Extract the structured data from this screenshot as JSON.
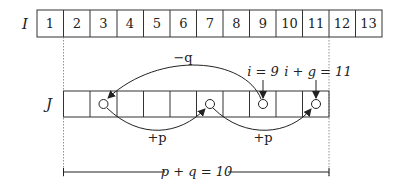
{
  "diagram": {
    "array_I": {
      "label": "I",
      "cells": [
        "1",
        "2",
        "3",
        "4",
        "5",
        "6",
        "7",
        "8",
        "9",
        "10",
        "11",
        "12",
        "13"
      ]
    },
    "array_J": {
      "label": "J",
      "cell_count": 10
    },
    "arcs": {
      "minus_q": {
        "label": "−q",
        "from": "J cell at i=9",
        "to": "J cell 3"
      },
      "plus_p_1": {
        "label": "+p",
        "from": "J cell 3",
        "to": "J cell 7"
      },
      "plus_p_2": {
        "label": "+p",
        "from": "J cell 7",
        "to": "J cell 11"
      }
    },
    "markers": {
      "i_label": "i = 9",
      "ig_label": "i + g = 11"
    },
    "span": {
      "label": "p + q = 10"
    },
    "colors": {
      "stroke": "#333333",
      "dotted": "#777777",
      "background": "#ffffff"
    }
  }
}
